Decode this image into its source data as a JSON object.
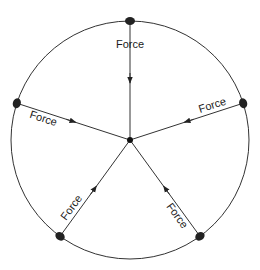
{
  "diagram": {
    "force_label": "Force",
    "labels": [
      "Force",
      "Force",
      "Force",
      "Force",
      "Force"
    ],
    "colors": {
      "line": "#333333",
      "mass": "#222222",
      "background": "#ffffff"
    },
    "center": [
      130,
      140
    ],
    "radius": 119,
    "mass_angles_deg": [
      -90,
      -18,
      54,
      126,
      198
    ]
  }
}
